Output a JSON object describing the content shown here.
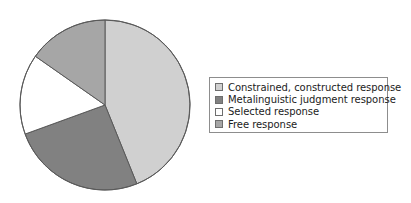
{
  "chart_data": {
    "type": "pie",
    "title": "",
    "categories": [
      "Constrained, constructed response",
      "Metalinguistic judgment response",
      "Selected response",
      "Free response"
    ],
    "values": [
      43.9,
      25.6,
      15.3,
      15.2
    ],
    "units": "percent",
    "start_angle_deg": 0,
    "direction": "clockwise",
    "slice_angles_deg": [
      158,
      92,
      55,
      55
    ],
    "colors": [
      "#d0d0d0",
      "#818181",
      "#ffffff",
      "#a6a6a6"
    ],
    "legend": {
      "position": "right",
      "entries": [
        {
          "label": "Constrained, constructed response",
          "color": "#d0d0d0",
          "swatch": "legend-swatch-light-gray"
        },
        {
          "label": "Metalinguistic judgment response",
          "color": "#818181",
          "swatch": "legend-swatch-dark-gray"
        },
        {
          "label": "Selected response",
          "color": "#ffffff",
          "swatch": "legend-swatch-white"
        },
        {
          "label": "Free response",
          "color": "#a6a6a6",
          "swatch": "legend-swatch-medium-gray"
        }
      ]
    },
    "grid": false,
    "xlabel": "",
    "ylabel": ""
  },
  "geometry": {
    "center_x": 87,
    "center_y": 88,
    "radius": 85,
    "outline_color": "#5a5a5a"
  }
}
